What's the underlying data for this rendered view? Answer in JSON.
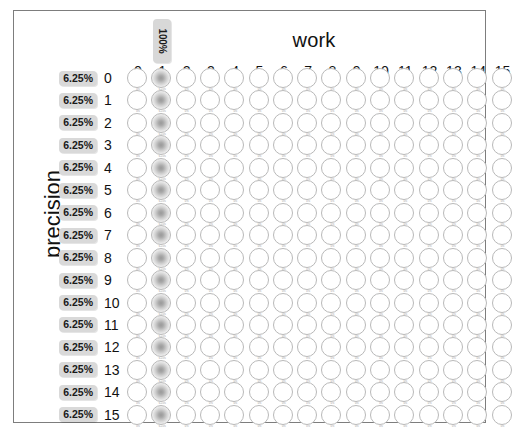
{
  "panel": {
    "border_color": "#7d7d7d",
    "background": "#ffffff"
  },
  "axes": {
    "x_title": "work",
    "y_title": "precision",
    "x_ticks": [
      "0",
      "1",
      "2",
      "3",
      "4",
      "5",
      "6",
      "7",
      "8",
      "9",
      "10",
      "11",
      "12",
      "13",
      "14",
      "15"
    ],
    "y_ticks": [
      "0",
      "1",
      "2",
      "3",
      "4",
      "5",
      "6",
      "7",
      "8",
      "9",
      "10",
      "11",
      "12",
      "13",
      "14",
      "15"
    ]
  },
  "top_marker": {
    "label": "100%",
    "column": 1,
    "background": "#d8d8d8"
  },
  "row_badges": [
    "6.25%",
    "6.25%",
    "6.25%",
    "6.25%",
    "6.25%",
    "6.25%",
    "6.25%",
    "6.25%",
    "6.25%",
    "6.25%",
    "6.25%",
    "6.25%",
    "6.25%",
    "6.25%",
    "6.25%",
    "6.25%"
  ],
  "badge_color": "#d9d9d9",
  "chart_data": {
    "type": "heatmap",
    "title": "",
    "xlabel": "work",
    "ylabel": "precision",
    "x": [
      0,
      1,
      2,
      3,
      4,
      5,
      6,
      7,
      8,
      9,
      10,
      11,
      12,
      13,
      14,
      15
    ],
    "y": [
      0,
      1,
      2,
      3,
      4,
      5,
      6,
      7,
      8,
      9,
      10,
      11,
      12,
      13,
      14,
      15
    ],
    "grid": false,
    "legend": "none",
    "marker_shape": "circle",
    "filled_column": 1,
    "column_totals_pct": [
      "0%",
      "100%",
      "0%",
      "0%",
      "0%",
      "0%",
      "0%",
      "0%",
      "0%",
      "0%",
      "0%",
      "0%",
      "0%",
      "0%",
      "0%",
      "0%"
    ],
    "row_totals_pct": [
      "6.25%",
      "6.25%",
      "6.25%",
      "6.25%",
      "6.25%",
      "6.25%",
      "6.25%",
      "6.25%",
      "6.25%",
      "6.25%",
      "6.25%",
      "6.25%",
      "6.25%",
      "6.25%",
      "6.25%",
      "6.25%"
    ],
    "values": [
      [
        0,
        1,
        0,
        0,
        0,
        0,
        0,
        0,
        0,
        0,
        0,
        0,
        0,
        0,
        0,
        0
      ],
      [
        0,
        1,
        0,
        0,
        0,
        0,
        0,
        0,
        0,
        0,
        0,
        0,
        0,
        0,
        0,
        0
      ],
      [
        0,
        1,
        0,
        0,
        0,
        0,
        0,
        0,
        0,
        0,
        0,
        0,
        0,
        0,
        0,
        0
      ],
      [
        0,
        1,
        0,
        0,
        0,
        0,
        0,
        0,
        0,
        0,
        0,
        0,
        0,
        0,
        0,
        0
      ],
      [
        0,
        1,
        0,
        0,
        0,
        0,
        0,
        0,
        0,
        0,
        0,
        0,
        0,
        0,
        0,
        0
      ],
      [
        0,
        1,
        0,
        0,
        0,
        0,
        0,
        0,
        0,
        0,
        0,
        0,
        0,
        0,
        0,
        0
      ],
      [
        0,
        1,
        0,
        0,
        0,
        0,
        0,
        0,
        0,
        0,
        0,
        0,
        0,
        0,
        0,
        0
      ],
      [
        0,
        1,
        0,
        0,
        0,
        0,
        0,
        0,
        0,
        0,
        0,
        0,
        0,
        0,
        0,
        0
      ],
      [
        0,
        1,
        0,
        0,
        0,
        0,
        0,
        0,
        0,
        0,
        0,
        0,
        0,
        0,
        0,
        0
      ],
      [
        0,
        1,
        0,
        0,
        0,
        0,
        0,
        0,
        0,
        0,
        0,
        0,
        0,
        0,
        0,
        0
      ],
      [
        0,
        1,
        0,
        0,
        0,
        0,
        0,
        0,
        0,
        0,
        0,
        0,
        0,
        0,
        0,
        0
      ],
      [
        0,
        1,
        0,
        0,
        0,
        0,
        0,
        0,
        0,
        0,
        0,
        0,
        0,
        0,
        0,
        0
      ],
      [
        0,
        1,
        0,
        0,
        0,
        0,
        0,
        0,
        0,
        0,
        0,
        0,
        0,
        0,
        0,
        0
      ],
      [
        0,
        1,
        0,
        0,
        0,
        0,
        0,
        0,
        0,
        0,
        0,
        0,
        0,
        0,
        0,
        0
      ],
      [
        0,
        1,
        0,
        0,
        0,
        0,
        0,
        0,
        0,
        0,
        0,
        0,
        0,
        0,
        0,
        0
      ],
      [
        0,
        1,
        0,
        0,
        0,
        0,
        0,
        0,
        0,
        0,
        0,
        0,
        0,
        0,
        0,
        0
      ]
    ]
  },
  "layout": {
    "grid_left": 113,
    "grid_top": 57,
    "col_pitch": 24.3,
    "row_pitch": 22.45
  }
}
